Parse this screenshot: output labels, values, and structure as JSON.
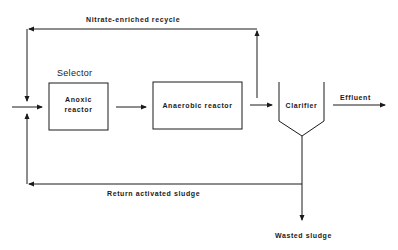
{
  "diagram": {
    "type": "process-flow",
    "colors": {
      "line": "#1a1a1a",
      "background": "#ffffff"
    }
  },
  "labels": {
    "recycle": "Nitrate-enriched recycle",
    "selector": "Selector",
    "anoxic_line1": "Anoxic",
    "anoxic_line2": "reactor",
    "anaerobic": "Anaerobic reactor",
    "clarifier": "Clarifier",
    "effluent": "Effluent",
    "return_sludge": "Return activated sludge",
    "wasted_sludge": "Wasted sludge"
  },
  "nodes": [
    {
      "id": "anoxic",
      "label": "Anoxic reactor",
      "group": "Selector"
    },
    {
      "id": "anaerobic",
      "label": "Anaerobic reactor"
    },
    {
      "id": "clarifier",
      "label": "Clarifier"
    }
  ],
  "edges": [
    {
      "from": "influent",
      "to": "anoxic"
    },
    {
      "from": "anoxic",
      "to": "anaerobic"
    },
    {
      "from": "anaerobic",
      "to": "clarifier"
    },
    {
      "from": "clarifier",
      "to": "effluent",
      "label": "Effluent"
    },
    {
      "from": "anaerobic-outlet",
      "to": "anoxic-inlet",
      "label": "Nitrate-enriched recycle"
    },
    {
      "from": "clarifier",
      "to": "anoxic-inlet",
      "label": "Return activated sludge"
    },
    {
      "from": "clarifier",
      "to": "waste",
      "label": "Wasted sludge"
    }
  ]
}
